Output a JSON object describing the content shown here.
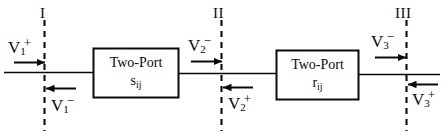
{
  "figure": {
    "type": "circuit-block-diagram",
    "background_color": "#ffffff",
    "line_color": "#0a0a0a"
  },
  "reference_planes": [
    {
      "id": "plane-1",
      "label": "I",
      "x": 44,
      "label_x": 40,
      "label_y": 6
    },
    {
      "id": "plane-2",
      "label": "II",
      "x": 221,
      "label_x": 214,
      "label_y": 6
    },
    {
      "id": "plane-3",
      "label": "III",
      "x": 406,
      "label_x": 396,
      "label_y": 6
    }
  ],
  "blocks": [
    {
      "id": "block-s",
      "title": "Two-Port",
      "symbol": "s",
      "subscript": "ij",
      "x": 93,
      "y": 48,
      "width": 85,
      "height": 49
    },
    {
      "id": "block-r",
      "title": "Two-Port",
      "symbol": "r",
      "subscript": "ij",
      "x": 276,
      "y": 50,
      "width": 82,
      "height": 49
    }
  ],
  "wave_labels": [
    {
      "id": "v1-plus",
      "var": "V",
      "sub": "1",
      "sup": "+",
      "x": 8,
      "y": 36,
      "direction": "right",
      "position": "above-line"
    },
    {
      "id": "v1-minus",
      "var": "V",
      "sub": "1",
      "sup": "−",
      "x": 51,
      "y": 94,
      "direction": "left",
      "position": "below-line"
    },
    {
      "id": "v2-minus",
      "var": "V",
      "sub": "2",
      "sup": "−",
      "x": 188,
      "y": 34,
      "direction": "right",
      "position": "above-line"
    },
    {
      "id": "v2-plus",
      "var": "V",
      "sub": "2",
      "sup": "+",
      "x": 228,
      "y": 92,
      "direction": "left",
      "position": "below-line"
    },
    {
      "id": "v3-minus",
      "var": "V",
      "sub": "3",
      "sup": "−",
      "x": 371,
      "y": 30,
      "direction": "right",
      "position": "above-line"
    },
    {
      "id": "v3-plus",
      "var": "V",
      "sub": "3",
      "sup": "+",
      "x": 412,
      "y": 88,
      "direction": "left",
      "position": "below-line"
    }
  ]
}
